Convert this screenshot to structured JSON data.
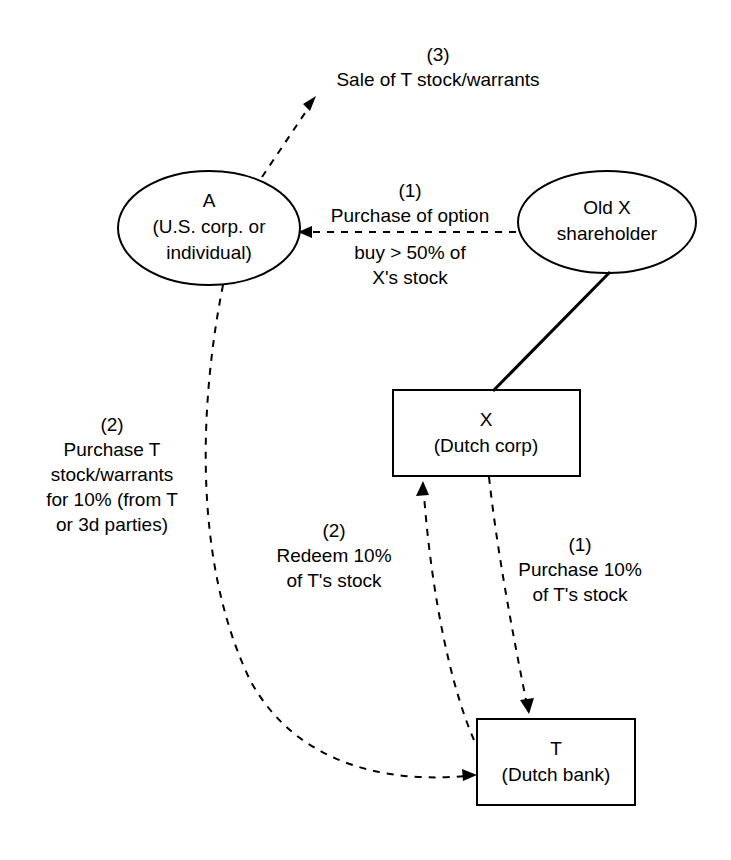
{
  "diagram": {
    "background_color": "#ffffff",
    "line_color": "#000000",
    "nodes": [
      {
        "id": "a",
        "shape": "ellipse",
        "label": "A\n(U.S. corp. or\nindividual)"
      },
      {
        "id": "old_x_shareholder",
        "shape": "ellipse",
        "label": "Old X\nshareholder"
      },
      {
        "id": "x",
        "shape": "rectangle",
        "label": "X\n(Dutch corp)"
      },
      {
        "id": "t",
        "shape": "rectangle",
        "label": "T\n(Dutch bank)"
      }
    ],
    "edge_labels": {
      "sale_of_t": "(3)\nSale of T stock/warrants",
      "purchase_option_top": "(1)\nPurchase of option",
      "purchase_option_bottom": "buy > 50% of\nX's stock",
      "purchase_t_stock": "(2)\nPurchase T\nstock/warrants\nfor 10% (from T\nor 3d parties)",
      "redeem": "(2)\nRedeem 10%\nof T's stock",
      "purchase_10": "(1)\nPurchase 10%\nof T's stock"
    }
  }
}
